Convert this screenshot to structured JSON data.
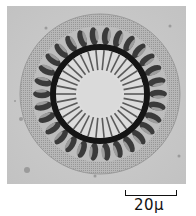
{
  "figure": {
    "colors": {
      "background": "#c9c9c9",
      "ring_dark": "#151515",
      "center_light": "#dcdcdc",
      "teeth": "#3a3a3a"
    },
    "center_rays": 34,
    "outer_segments": 30
  },
  "scale_bar": {
    "label": "20µ"
  }
}
